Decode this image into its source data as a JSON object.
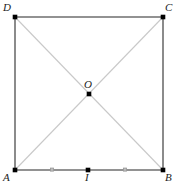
{
  "figure": {
    "type": "geometry-diagram",
    "shape": "square",
    "canvas": {
      "width": 174,
      "height": 185
    },
    "colors": {
      "background": "#ffffff",
      "edge": "#6e6e6e",
      "diagonal": "#c9c9c9",
      "point": "#000000",
      "tick": "#9a9a9a",
      "label": "#1c1c1c"
    },
    "stroke_widths": {
      "edge": 1.6,
      "diagonal": 1.1,
      "tick": 1.2
    },
    "vertices": [
      {
        "id": "D",
        "label": "D",
        "x": 15,
        "y": 17,
        "label_x": 3,
        "label_y": 2,
        "dot": true
      },
      {
        "id": "C",
        "label": "C",
        "x": 163,
        "y": 17,
        "label_x": 165,
        "label_y": 2,
        "dot": true
      },
      {
        "id": "A",
        "label": "A",
        "x": 15,
        "y": 170,
        "label_x": 3,
        "label_y": 172,
        "dot": true
      },
      {
        "id": "B",
        "label": "B",
        "x": 163,
        "y": 170,
        "label_x": 165,
        "label_y": 172,
        "dot": true
      }
    ],
    "interior_points": [
      {
        "id": "O",
        "label": "O",
        "x": 89,
        "y": 94,
        "label_x": 84,
        "label_y": 79,
        "dot": true
      },
      {
        "id": "I",
        "label": "I",
        "x": 88,
        "y": 170,
        "label_x": 85,
        "label_y": 172,
        "dot": true
      }
    ],
    "edges": [
      {
        "id": "DC",
        "from": "D",
        "to": "C",
        "x1": 15,
        "y1": 17,
        "x2": 163,
        "y2": 17
      },
      {
        "id": "CB",
        "from": "C",
        "to": "B",
        "x1": 163,
        "y1": 17,
        "x2": 163,
        "y2": 170
      },
      {
        "id": "AB",
        "from": "A",
        "to": "B",
        "x1": 15,
        "y1": 170,
        "x2": 163,
        "y2": 170
      },
      {
        "id": "AD",
        "from": "A",
        "to": "D",
        "x1": 15,
        "y1": 170,
        "x2": 15,
        "y2": 17
      }
    ],
    "diagonals": [
      {
        "id": "AC",
        "from": "A",
        "to": "C",
        "x1": 15,
        "y1": 170,
        "x2": 163,
        "y2": 17
      },
      {
        "id": "DB",
        "from": "D",
        "to": "B",
        "x1": 15,
        "y1": 17,
        "x2": 163,
        "y2": 170
      }
    ],
    "tick_marks": [
      {
        "id": "tick-AI",
        "on": "AB",
        "x": 52,
        "y": 170,
        "size": 3
      },
      {
        "id": "tick-IB",
        "on": "AB",
        "x": 125,
        "y": 170,
        "size": 3
      }
    ],
    "labels": {
      "D": "D",
      "C": "C",
      "A": "A",
      "B": "B",
      "O": "O",
      "I": "I"
    }
  }
}
